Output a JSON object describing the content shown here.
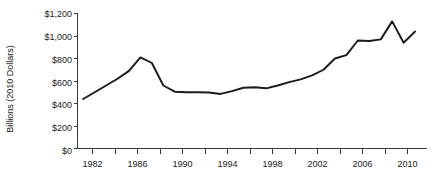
{
  "chart_data": {
    "type": "line",
    "title": "",
    "xlabel": "",
    "ylabel": "Billions (2010 Dollars)",
    "xlim": [
      1980.5,
      2011
    ],
    "ylim": [
      0,
      1200
    ],
    "grid": false,
    "legend": null,
    "y_ticks": [
      0,
      200,
      400,
      600,
      800,
      1000,
      1200
    ],
    "y_tick_labels": [
      "$0",
      "$200",
      "$400",
      "$600",
      "$800",
      "$1,000",
      "$1,200"
    ],
    "x_ticks": [
      1982,
      1984,
      1986,
      1988,
      1990,
      1992,
      1994,
      1996,
      1998,
      2000,
      2002,
      2004,
      2006,
      2008,
      2010
    ],
    "x_tick_labels": [
      "1982",
      "",
      "1986",
      "",
      "1990",
      "",
      "1994",
      "",
      "1998",
      "",
      "2002",
      "",
      "2006",
      "",
      "2010"
    ],
    "x_major_labels": [
      "1982",
      "1986",
      "1990",
      "1994",
      "1998",
      "2002",
      "2006",
      "2010"
    ],
    "series": [
      {
        "name": "Spending",
        "color": "#1a1a1a",
        "x": [
          1981,
          1982,
          1983,
          1984,
          1985,
          1986,
          1987,
          1988,
          1989,
          1990,
          1991,
          1992,
          1993,
          1994,
          1995,
          1996,
          1997,
          1998,
          1999,
          2000,
          2001,
          2002,
          2003,
          2004,
          2005,
          2006,
          2007,
          2008,
          2009,
          2010
        ],
        "values": [
          440,
          500,
          560,
          620,
          690,
          810,
          760,
          560,
          505,
          500,
          500,
          498,
          485,
          510,
          540,
          545,
          535,
          560,
          590,
          615,
          650,
          700,
          800,
          830,
          960,
          955,
          970,
          1130,
          940,
          1040
        ]
      }
    ]
  },
  "axis": {
    "y_title": "Billions (2010 Dollars)"
  }
}
